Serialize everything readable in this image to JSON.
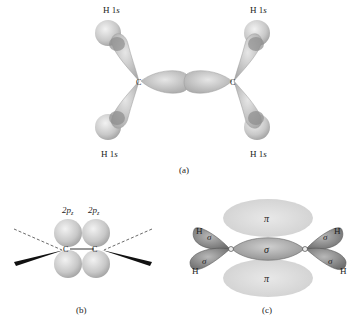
{
  "panel_a": {
    "caption": "(a)",
    "h_labels": [
      "H 1s",
      "H 1s",
      "H 1s",
      "H 1s"
    ],
    "carbon_labels": [
      "C",
      "C"
    ]
  },
  "panel_b": {
    "caption": "(b)",
    "orbital_labels": [
      "2p",
      "2p"
    ],
    "orbital_subscript": "z",
    "carbon_labels": [
      "C",
      "C"
    ]
  },
  "panel_c": {
    "caption": "(c)",
    "pi_labels": [
      "π",
      "π"
    ],
    "sigma_center": "σ",
    "sigma_ch": [
      "σ",
      "σ",
      "σ",
      "σ"
    ],
    "h_labels": [
      "H",
      "H",
      "H",
      "H"
    ],
    "carbon_labels": [
      "C",
      "C"
    ]
  },
  "colors": {
    "lobe_light": "#d8d8d8",
    "lobe_mid": "#b8b8b8",
    "lobe_dark": "#8a8a8a",
    "pi_cloud": "#dcdcdc"
  }
}
